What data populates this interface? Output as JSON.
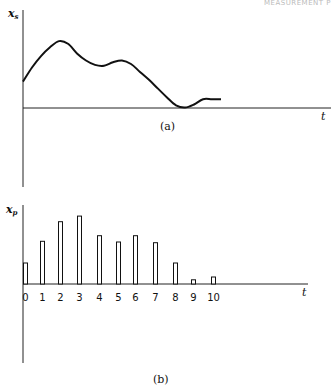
{
  "page": {
    "header_right": "MEASUREMENT P"
  },
  "chart_data": [
    {
      "type": "line",
      "title": "",
      "caption": "(a)",
      "ylabel": "x_s",
      "ylabel_main": "x",
      "ylabel_sub": "s",
      "xlabel": "t",
      "description": "Continuous signal x_s(t)",
      "x": [
        0,
        0.5,
        1,
        1.5,
        2,
        2.5,
        3,
        3.5,
        4,
        4.5,
        5,
        5.5,
        6,
        6.5,
        7,
        7.5,
        8,
        8.5,
        9,
        9.5,
        10,
        10.5,
        11
      ],
      "y": [
        3.0,
        4.6,
        5.9,
        6.9,
        7.6,
        7.3,
        6.2,
        5.4,
        4.9,
        4.8,
        5.2,
        5.4,
        5.0,
        4.1,
        3.2,
        2.2,
        1.2,
        0.3,
        0.05,
        0.4,
        1.0,
        1.0,
        1.0
      ],
      "xlim": [
        0,
        12
      ],
      "ylim": [
        -4.5,
        9
      ],
      "grid": false
    },
    {
      "type": "bar",
      "title": "",
      "caption": "(b)",
      "ylabel": "x_p",
      "ylabel_main": "x",
      "ylabel_sub": "p",
      "xlabel": "t",
      "description": "Sampled signal x_p at discrete instants",
      "categories": [
        "0",
        "1",
        "2",
        "3",
        "4",
        "5",
        "6",
        "7",
        "8",
        "9",
        "10"
      ],
      "values": [
        3.0,
        6.1,
        8.9,
        9.7,
        6.9,
        6.0,
        6.9,
        5.9,
        3.0,
        0.6,
        1.0
      ],
      "ylim": [
        -11,
        11
      ],
      "grid": false
    }
  ]
}
